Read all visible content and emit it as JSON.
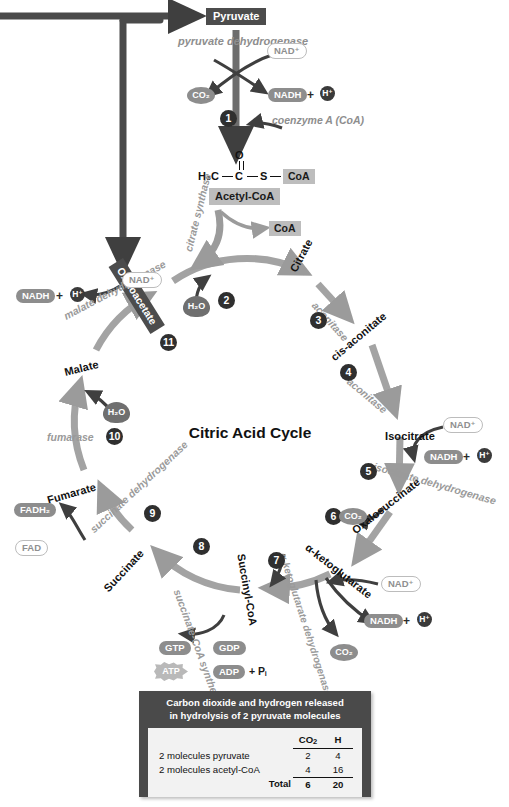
{
  "title": "Citric Acid Cycle",
  "top_pathway": {
    "substrate": "Pyruvate",
    "enzyme": "pyruvate dehydrogenase",
    "cofactor_in": "NAD+",
    "products": {
      "co2": "CO2",
      "nadh": "NADH",
      "plus": "+",
      "hplus": "H+"
    },
    "step": "1",
    "coenzyme": "coenzyme A (CoA)",
    "formula": {
      "methyl": "H3C",
      "carbon": "C",
      "oxygen": "O",
      "sulfur": "S",
      "coa": "CoA"
    },
    "acetyl_label": "Acetyl-CoA",
    "coa_release": "CoA"
  },
  "metabolites": {
    "oxaloacetate": "Oxaloacetate",
    "citrate": "Citrate",
    "cis_aconitate": "cis-aconitate",
    "isocitrate": "Isocitrate",
    "oxalosuccinate": "Oxalosuccinate",
    "alpha_ketoglutarate": "α-ketoglutarate",
    "succinyl_coa": "Succinyl-CoA",
    "succinate": "Succinate",
    "fumarate": "Fumarate",
    "malate": "Malate"
  },
  "enzymes": {
    "citrate_synthase": "citrate synthase",
    "aconitase_3": "aconitase",
    "aconitase_4": "aconitase",
    "isocitrate_dehydrogenase": "isocitrate dehydrogenase",
    "akg_complex": "α-ketoglutarate dehydrogenase complex",
    "succinate_coa_synthetase": "succinate-CoA synthetase",
    "succinate_dehydrogenase": "succinate dehydrogenase",
    "fumarase": "fumarase",
    "malate_dehydrogenase": "malate dehydrogenase"
  },
  "steps": {
    "s1": "1",
    "s2": "2",
    "s3": "3",
    "s4": "4",
    "s5": "5",
    "s6": "6",
    "s7": "7",
    "s8": "8",
    "s9": "9",
    "s10": "10",
    "s11": "11"
  },
  "cofactors": {
    "nad_isocitrate": "NAD+",
    "nadh_isocitrate": "NADH",
    "h_isocitrate": "H+",
    "nad_akg": "NAD+",
    "nadh_akg": "NADH",
    "h_akg": "H+",
    "nad_malate": "NAD+",
    "nadh_malate": "NADH",
    "h_malate": "H+",
    "fad": "FAD",
    "fadh2": "FADH2",
    "gtp": "GTP",
    "gdp": "GDP",
    "atp": "ATP",
    "adp": "ADP",
    "pi": "+ Pi"
  },
  "small_molecules": {
    "h2o_citrate": "H2O",
    "h2o_fumarate": "H2O",
    "co2_step6": "CO2",
    "co2_step7": "CO2"
  },
  "summary_table": {
    "caption_line1": "Carbon dioxide and hydrogen released",
    "caption_line2": "in hydrolysis of 2 pyruvate molecules",
    "columns": [
      "",
      "CO2",
      "H"
    ],
    "rows": [
      {
        "label": "2 molecules pyruvate",
        "co2": "2",
        "h": "4"
      },
      {
        "label": "2 molecules acetyl-CoA",
        "co2": "4",
        "h": "16"
      }
    ],
    "total": {
      "label": "Total",
      "co2": "6",
      "h": "20"
    }
  },
  "colors": {
    "ring": "#a3a3a3",
    "dark_box": "#4c4c4c",
    "grey_box": "#bdbdbd",
    "arrow_dark": "#3f3f3f",
    "arrow_grey": "#9b9b9b",
    "enzyme_text": "#9a9a9a",
    "panel_bg": "#4a4a4a"
  }
}
